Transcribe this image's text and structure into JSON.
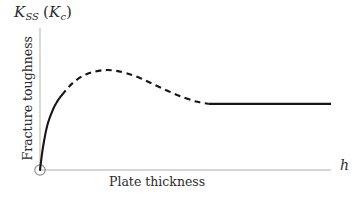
{
  "figure": {
    "background_color": "#ffffff",
    "axis_color": "#c9c9c9",
    "curve_color": "#161616",
    "width": 359,
    "height": 199
  },
  "axes": {
    "y_symbol": {
      "base": "K",
      "subscript": "SS",
      "open_paren": "(",
      "paren_base": "K",
      "paren_subscript": "c",
      "close_paren": ")",
      "full_text": "K_SS (K_c)"
    },
    "y_title": "Fracture toughness",
    "x_title": "Plate thickness",
    "x_symbol": "h",
    "origin_marker": "origin-circle"
  },
  "chart_data": {
    "type": "line",
    "title": "",
    "subtitle": "",
    "xlabel": "Plate thickness",
    "ylabel": "Fracture toughness",
    "x_axis_symbol": "h",
    "y_axis_symbol": "K_SS (K_c)",
    "grid": false,
    "legend": null,
    "legend_position": "none",
    "xlim": [
      0,
      1
    ],
    "ylim": [
      0,
      1
    ],
    "x_tick_labels": [],
    "y_tick_labels": [],
    "annotations": [
      "origin marked with small open circle",
      "solid segment: plane-strain rise from origin",
      "dashed segment: transitional mixed-mode region through the maximum",
      "solid segment: plane-strain plateau at K_c"
    ],
    "series": [
      {
        "name": "Fracture toughness curve",
        "style": "solid",
        "color": "#161616",
        "comment": "steep initial rise from the origin",
        "x": [
          0.0,
          0.01,
          0.025,
          0.045,
          0.06,
          0.075
        ],
        "y": [
          0.0,
          0.165,
          0.33,
          0.45,
          0.51,
          0.555
        ]
      },
      {
        "name": "Fracture toughness curve (transition)",
        "style": "dashed",
        "color": "#161616",
        "comment": "rises to a maximum then decays toward the plateau",
        "x": [
          0.075,
          0.11,
          0.15,
          0.19,
          0.225,
          0.26,
          0.3,
          0.345,
          0.39,
          0.44,
          0.49,
          0.54,
          0.58
        ],
        "y": [
          0.555,
          0.64,
          0.7,
          0.73,
          0.74,
          0.735,
          0.715,
          0.68,
          0.635,
          0.585,
          0.54,
          0.505,
          0.49
        ]
      },
      {
        "name": "Fracture toughness curve (plateau)",
        "style": "solid",
        "color": "#161616",
        "comment": "constant plane-strain fracture toughness K_c",
        "x": [
          0.58,
          0.7,
          0.82,
          1.0
        ],
        "y": [
          0.49,
          0.49,
          0.49,
          0.49
        ]
      }
    ]
  }
}
